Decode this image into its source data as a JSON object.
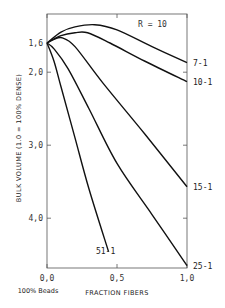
{
  "chart_data": {
    "type": "line",
    "title": "",
    "xlabel": "FRACTION FIBERS",
    "ylabel": "BULK VOLUME (1.0 = 100% DENSE)",
    "x_sublabel": "100% Beads",
    "annotation": "R = 10",
    "xlim": [
      0.0,
      1.0
    ],
    "ylim": [
      1.4,
      4.7
    ],
    "y_inverted": true,
    "grid": false,
    "x_ticks": [
      {
        "value": 0.0,
        "label": "0,0"
      },
      {
        "value": 0.5,
        "label": "0,5"
      },
      {
        "value": 1.0,
        "label": "1,0"
      }
    ],
    "y_ticks": [
      {
        "value": 1.6,
        "label": "1,6"
      },
      {
        "value": 2.0,
        "label": "2,0"
      },
      {
        "value": 3.0,
        "label": "3,0"
      },
      {
        "value": 4.0,
        "label": "4,0"
      }
    ],
    "series": [
      {
        "name": "7-1",
        "x": [
          0.0,
          0.1,
          0.2,
          0.34,
          0.5,
          0.75,
          1.0
        ],
        "values": [
          1.6,
          1.45,
          1.38,
          1.35,
          1.42,
          1.65,
          1.87
        ]
      },
      {
        "name": "10-1",
        "x": [
          0.0,
          0.1,
          0.2,
          0.29,
          0.45,
          0.7,
          1.0
        ],
        "values": [
          1.6,
          1.5,
          1.46,
          1.46,
          1.6,
          1.85,
          2.13
        ]
      },
      {
        "name": "15-1",
        "x": [
          0.0,
          0.05,
          0.11,
          0.2,
          0.4,
          0.7,
          1.0
        ],
        "values": [
          1.6,
          1.55,
          1.53,
          1.65,
          2.15,
          2.85,
          3.57
        ]
      },
      {
        "name": "25-1",
        "x": [
          0.0,
          0.05,
          0.15,
          0.3,
          0.5,
          0.75,
          1.0
        ],
        "values": [
          1.6,
          1.68,
          1.95,
          2.5,
          3.25,
          3.95,
          4.65
        ]
      },
      {
        "name": "51-1",
        "x": [
          0.0,
          0.05,
          0.1,
          0.2,
          0.3,
          0.44
        ],
        "values": [
          1.6,
          1.85,
          2.2,
          2.9,
          3.6,
          4.46
        ]
      }
    ]
  }
}
